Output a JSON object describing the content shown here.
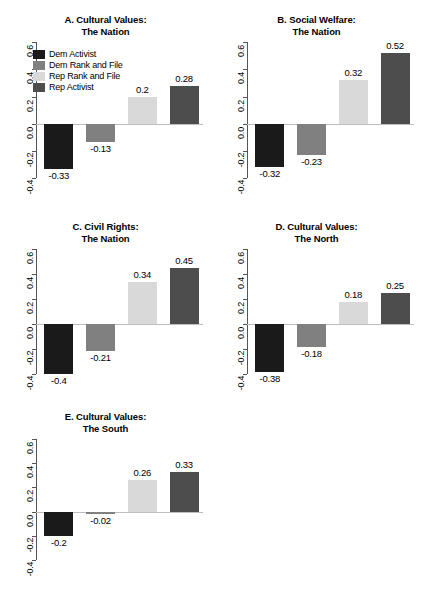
{
  "figure": {
    "legend": {
      "entries": [
        {
          "label": "Dem Activist",
          "color": "#1a1a1a"
        },
        {
          "label": "Dem Rank and File",
          "color": "#808080"
        },
        {
          "label": "Rep Rank and File",
          "color": "#d9d9d9"
        },
        {
          "label": "Rep Activist",
          "color": "#4d4d4d"
        }
      ]
    },
    "axis": {
      "ticks": [
        "0.6",
        "0.4",
        "0.2",
        "0.0",
        "-0.2",
        "-0.4"
      ],
      "tick_values": [
        0.6,
        0.4,
        0.2,
        0.0,
        -0.2,
        -0.4
      ],
      "ylim": [
        -0.5,
        0.6
      ]
    }
  },
  "chart_data": [
    {
      "type": "bar",
      "panel": "A",
      "title_line1": "A. Cultural Values:",
      "title_line2": "The Nation",
      "categories": [
        "Dem Activist",
        "Dem Rank and File",
        "Rep Rank and File",
        "Rep Activist"
      ],
      "values": [
        -0.33,
        -0.13,
        0.2,
        0.28
      ],
      "labels": [
        "-0.33",
        "-0.13",
        "0.2",
        "0.28"
      ],
      "colors": [
        "#1a1a1a",
        "#808080",
        "#d9d9d9",
        "#4d4d4d"
      ],
      "xlabel": "",
      "ylabel": "",
      "ylim": [
        -0.5,
        0.6
      ],
      "yticks": [
        0.6,
        0.4,
        0.2,
        0.0,
        -0.2,
        -0.4
      ],
      "grid": false,
      "legend_position": "top-left"
    },
    {
      "type": "bar",
      "panel": "B",
      "title_line1": "B. Social Welfare:",
      "title_line2": "The Nation",
      "categories": [
        "Dem Activist",
        "Dem Rank and File",
        "Rep Rank and File",
        "Rep Activist"
      ],
      "values": [
        -0.32,
        -0.23,
        0.32,
        0.52
      ],
      "labels": [
        "-0.32",
        "-0.23",
        "0.32",
        "0.52"
      ],
      "colors": [
        "#1a1a1a",
        "#808080",
        "#d9d9d9",
        "#4d4d4d"
      ],
      "xlabel": "",
      "ylabel": "",
      "ylim": [
        -0.5,
        0.6
      ],
      "yticks": [
        0.6,
        0.4,
        0.2,
        0.0,
        -0.2,
        -0.4
      ],
      "grid": false,
      "legend_position": "none"
    },
    {
      "type": "bar",
      "panel": "C",
      "title_line1": "C. Civil Rights:",
      "title_line2": "The Nation",
      "categories": [
        "Dem Activist",
        "Dem Rank and File",
        "Rep Rank and File",
        "Rep Activist"
      ],
      "values": [
        -0.4,
        -0.21,
        0.34,
        0.45
      ],
      "labels": [
        "-0.4",
        "-0.21",
        "0.34",
        "0.45"
      ],
      "colors": [
        "#1a1a1a",
        "#808080",
        "#d9d9d9",
        "#4d4d4d"
      ],
      "xlabel": "",
      "ylabel": "",
      "ylim": [
        -0.5,
        0.6
      ],
      "yticks": [
        0.6,
        0.4,
        0.2,
        0.0,
        -0.2,
        -0.4
      ],
      "grid": false,
      "legend_position": "none"
    },
    {
      "type": "bar",
      "panel": "D",
      "title_line1": "D. Cultural Values:",
      "title_line2": "The North",
      "categories": [
        "Dem Activist",
        "Dem Rank and File",
        "Rep Rank and File",
        "Rep Activist"
      ],
      "values": [
        -0.38,
        -0.18,
        0.18,
        0.25
      ],
      "labels": [
        "-0.38",
        "-0.18",
        "0.18",
        "0.25"
      ],
      "colors": [
        "#1a1a1a",
        "#808080",
        "#d9d9d9",
        "#4d4d4d"
      ],
      "xlabel": "",
      "ylabel": "",
      "ylim": [
        -0.5,
        0.6
      ],
      "yticks": [
        0.6,
        0.4,
        0.2,
        0.0,
        -0.2,
        -0.4
      ],
      "grid": false,
      "legend_position": "none"
    },
    {
      "type": "bar",
      "panel": "E",
      "title_line1": "E. Cultural Values:",
      "title_line2": "The South",
      "categories": [
        "Dem Activist",
        "Dem Rank and File",
        "Rep Rank and File",
        "Rep Activist"
      ],
      "values": [
        -0.2,
        -0.02,
        0.26,
        0.33
      ],
      "labels": [
        "-0.2",
        "-0.02",
        "0.26",
        "0.33"
      ],
      "colors": [
        "#1a1a1a",
        "#808080",
        "#d9d9d9",
        "#4d4d4d"
      ],
      "xlabel": "",
      "ylabel": "",
      "ylim": [
        -0.5,
        0.6
      ],
      "yticks": [
        0.6,
        0.4,
        0.2,
        0.0,
        -0.2,
        -0.4
      ],
      "grid": false,
      "legend_position": "none"
    }
  ]
}
